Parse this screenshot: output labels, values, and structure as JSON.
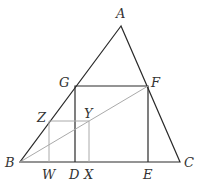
{
  "diagram": {
    "type": "geometry",
    "points": {
      "A": {
        "x": 121,
        "y": 26,
        "label": "A",
        "lx": 117,
        "ly": 18
      },
      "B": {
        "x": 20,
        "y": 162,
        "label": "B",
        "lx": 6,
        "ly": 166
      },
      "C": {
        "x": 180,
        "y": 162,
        "label": "C",
        "lx": 185,
        "ly": 166
      },
      "G": {
        "x": 75,
        "y": 86,
        "label": "G",
        "lx": 60,
        "ly": 86
      },
      "F": {
        "x": 148,
        "y": 86,
        "label": "F",
        "lx": 151,
        "ly": 86
      },
      "D": {
        "x": 75,
        "y": 162,
        "label": "D",
        "lx": 69,
        "ly": 178
      },
      "E": {
        "x": 148,
        "y": 162,
        "label": "E",
        "lx": 143,
        "ly": 178
      },
      "Z": {
        "x": 49,
        "y": 121,
        "label": "Z",
        "lx": 37,
        "ly": 121
      },
      "Y": {
        "x": 89,
        "y": 121,
        "label": "Y",
        "lx": 84,
        "ly": 117
      },
      "W": {
        "x": 49,
        "y": 162,
        "label": "W",
        "lx": 42,
        "ly": 178
      },
      "X": {
        "x": 89,
        "y": 162,
        "label": "X",
        "lx": 84,
        "ly": 178
      }
    },
    "colors": {
      "main_stroke": "#2a2a2a",
      "light_stroke": "#aaaaaa"
    }
  }
}
